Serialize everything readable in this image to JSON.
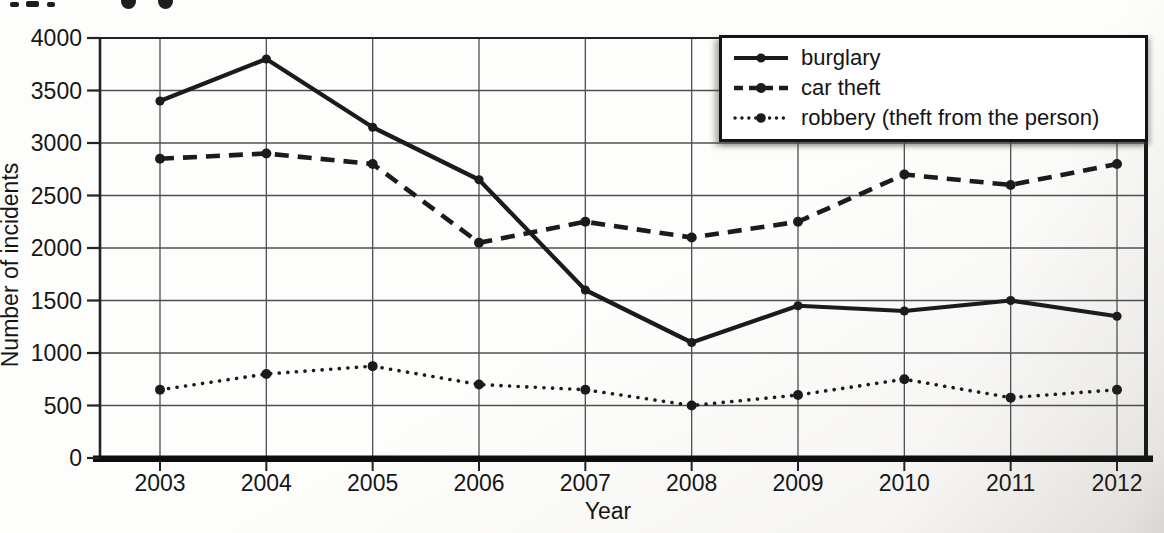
{
  "chart_data": {
    "type": "line",
    "title": "",
    "xlabel": "Year",
    "ylabel": "Number of incidents",
    "categories": [
      2003,
      2004,
      2005,
      2006,
      2007,
      2008,
      2009,
      2010,
      2011,
      2012
    ],
    "yticks": [
      0,
      500,
      1000,
      1500,
      2000,
      2500,
      3000,
      3500,
      4000
    ],
    "ylim": [
      0,
      4000
    ],
    "grid": true,
    "legend_position": "top-right",
    "line_color": "#1b1b1b",
    "series": [
      {
        "name": "burglary",
        "style": "solid",
        "values": [
          3400,
          3800,
          3150,
          2650,
          1600,
          1100,
          1450,
          1400,
          1500,
          1350
        ]
      },
      {
        "name": "car theft",
        "style": "dashed",
        "values": [
          2850,
          2900,
          2800,
          2050,
          2250,
          2100,
          2250,
          2700,
          2600,
          2800
        ]
      },
      {
        "name": "robbery (theft from the person)",
        "style": "dotted",
        "values": [
          650,
          800,
          875,
          700,
          650,
          500,
          600,
          750,
          575,
          650
        ]
      }
    ]
  }
}
